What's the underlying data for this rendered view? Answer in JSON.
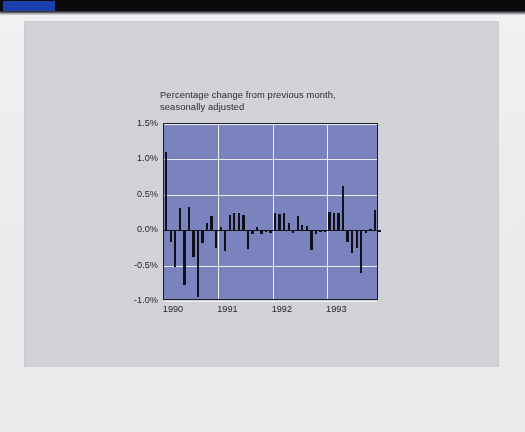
{
  "topbar": {
    "accent_color": "#1c3fae",
    "bar_color": "#0a0a0c"
  },
  "panel": {
    "background_color": "#d2d4d7"
  },
  "chart_data": {
    "type": "bar",
    "title": "Percentage change from previous month,\nseasonally adjusted",
    "xlabel": "",
    "ylabel": "",
    "ylim": [
      -1.0,
      1.5
    ],
    "xlim": [
      1990.0,
      1993.95
    ],
    "grid": true,
    "legend": null,
    "plot_background_color": "#7b84bf",
    "bar_color": "#101018",
    "gridline_color": "#eef0f5",
    "ytick_labels": [
      "1.5%",
      "1.0%",
      "0.5%",
      "0.0%",
      "-0.5%",
      "-1.0%"
    ],
    "ytick_values": [
      1.5,
      1.0,
      0.5,
      0.0,
      -0.5,
      -1.0
    ],
    "xtick_labels": [
      "1990",
      "1991",
      "1992",
      "1993"
    ],
    "xtick_values": [
      1990,
      1991,
      1992,
      1993
    ],
    "x": [
      1990.0,
      1990.083,
      1990.167,
      1990.25,
      1990.333,
      1990.417,
      1990.5,
      1990.583,
      1990.667,
      1990.75,
      1990.833,
      1990.917,
      1991.0,
      1991.083,
      1991.167,
      1991.25,
      1991.333,
      1991.417,
      1991.5,
      1991.583,
      1991.667,
      1991.75,
      1991.833,
      1991.917,
      1992.0,
      1992.083,
      1992.167,
      1992.25,
      1992.333,
      1992.417,
      1992.5,
      1992.583,
      1992.667,
      1992.75,
      1992.833,
      1992.917,
      1993.0,
      1993.083,
      1993.167,
      1993.25,
      1993.333,
      1993.417,
      1993.5,
      1993.583,
      1993.667,
      1993.75,
      1993.833,
      1993.917
    ],
    "values": [
      1.1,
      -0.17,
      -0.52,
      0.32,
      -0.78,
      0.33,
      -0.38,
      -0.95,
      -0.18,
      0.1,
      0.2,
      -0.25,
      0.05,
      -0.3,
      0.22,
      0.25,
      0.24,
      0.22,
      -0.26,
      -0.06,
      0.04,
      -0.05,
      -0.02,
      -0.04,
      0.24,
      0.23,
      0.25,
      0.1,
      -0.04,
      0.2,
      0.08,
      0.06,
      -0.28,
      -0.06,
      -0.02,
      -0.03,
      0.26,
      0.24,
      0.25,
      0.62,
      -0.17,
      -0.32,
      -0.25,
      -0.6,
      -0.04,
      0.02,
      0.28,
      -0.02
    ]
  }
}
